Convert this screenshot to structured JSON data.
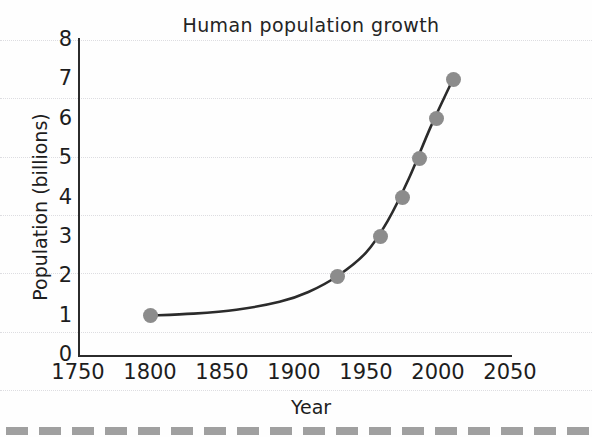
{
  "chart_data": {
    "type": "line",
    "title": "Human population growth",
    "xlabel": "Year",
    "ylabel": "Population (billions)",
    "xlim": [
      1750,
      2050
    ],
    "ylim": [
      0,
      8
    ],
    "xticks": [
      1750,
      1800,
      1850,
      1900,
      1950,
      2000,
      2050
    ],
    "xtick_labels": [
      "1750",
      "1800",
      "1850",
      "1900",
      "1950",
      "2000",
      "2050"
    ],
    "yticks": [
      0,
      1,
      2,
      3,
      4,
      5,
      6,
      7,
      8
    ],
    "ytick_labels": [
      "0",
      "1",
      "2",
      "3",
      "4",
      "5",
      "6",
      "7",
      "8"
    ],
    "grid": true,
    "grid_orientation": "horizontal",
    "legend": "none",
    "marker_color": "#8c8c8c",
    "line_color": "#2b2b2b",
    "series": [
      {
        "name": "World population",
        "x": [
          1800,
          1930,
          1960,
          1975,
          1987,
          1999,
          2011
        ],
        "values": [
          1,
          2,
          3,
          4,
          5,
          6,
          7
        ]
      }
    ],
    "curve_x": [
      1800,
      1830,
      1860,
      1890,
      1910,
      1930,
      1950,
      1965,
      1980,
      1995,
      2011
    ],
    "curve_y": [
      1.0,
      1.05,
      1.15,
      1.35,
      1.6,
      2.0,
      2.6,
      3.4,
      4.5,
      5.8,
      7.05
    ]
  },
  "annotations": {
    "bottom_strip": "dashed-page-edge"
  }
}
